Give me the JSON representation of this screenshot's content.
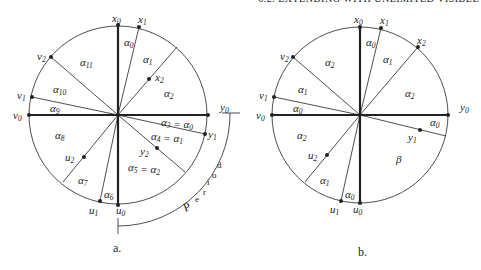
{
  "header": "6.2. EXTENDING WITH UNLIMITED VISIBLE",
  "figure_a": {
    "caption": "a.",
    "points": {
      "x0": "x",
      "x1": "x",
      "x2": "x",
      "y0": "y",
      "y1": "y",
      "y2": "y",
      "u0": "u",
      "u1": "u",
      "u2": "u",
      "v0": "v",
      "v1": "v",
      "v2": "v"
    },
    "sector_labels": [
      "α0",
      "α1",
      "α2",
      "α3 = α0",
      "α4 = α1",
      "α5 = α2",
      "α6",
      "α7",
      "α8",
      "α9",
      "α10",
      "α11"
    ],
    "bracket_label": "period"
  },
  "figure_b": {
    "caption": "b.",
    "sector_labels": [
      "α0",
      "α1",
      "α2",
      "α0",
      "β",
      "α0",
      "α1",
      "α2",
      "α0",
      "α1",
      "α2"
    ]
  }
}
